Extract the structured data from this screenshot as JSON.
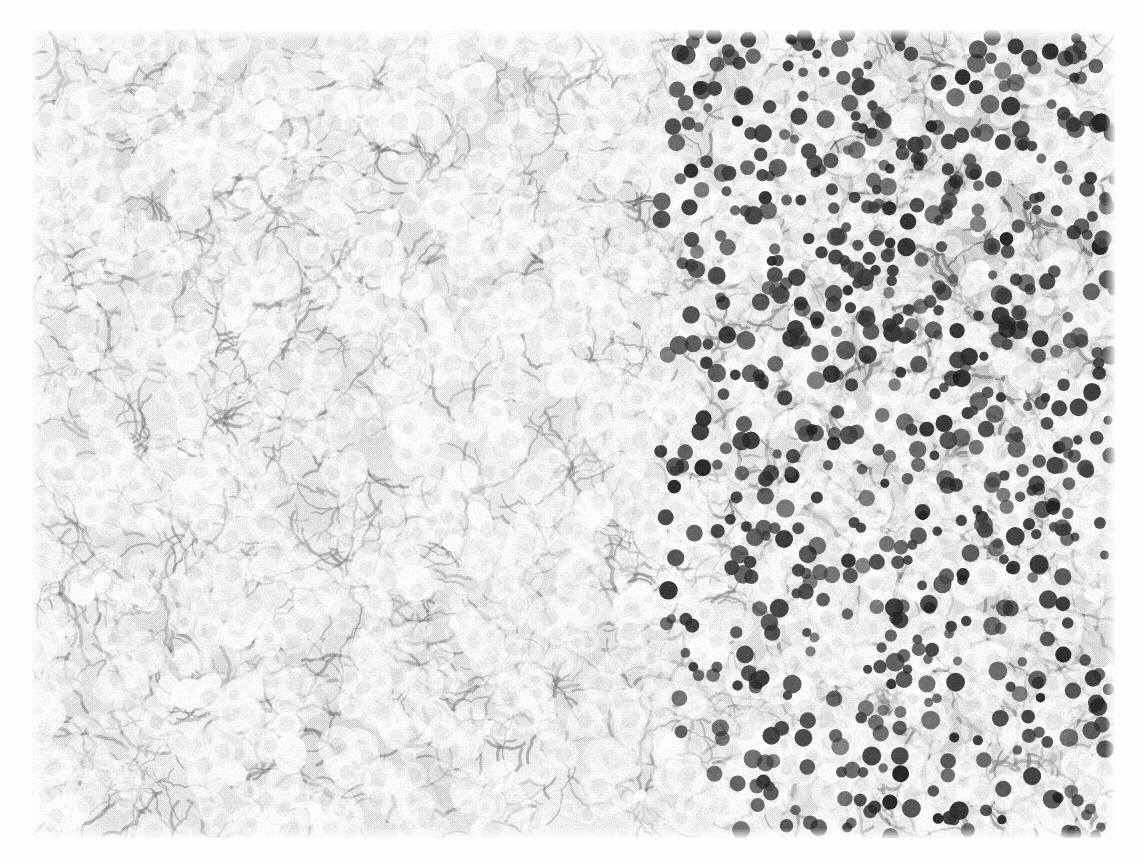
{
  "page": {
    "kind": "printed-page-scan",
    "background_color": "#fefefe",
    "width": 1144,
    "height": 860
  },
  "figure": {
    "name": "histology-micrograph",
    "modality": "light-microscopy",
    "stain": "hematoxylin-and-eosin",
    "color_mode": "grayscale",
    "tissue": "liver-hepatocellular-parenchyma",
    "bounds": {
      "x": 32,
      "y": 30,
      "width": 1083,
      "height": 808
    },
    "tone": {
      "paper_white": "#fdfdfd",
      "cytoplasm_light": "#f4f4f2",
      "stroma_mid": "#9a9a98",
      "nucleus_dark": "#3a3a3a",
      "darkest": "#202020"
    },
    "regions": [
      {
        "name": "upper-right-dense",
        "x": 0.62,
        "y": 0.02,
        "w": 0.38,
        "h": 0.42,
        "density": 1.0
      },
      {
        "name": "right-band-dense",
        "x": 0.78,
        "y": 0.3,
        "w": 0.22,
        "h": 0.7,
        "density": 0.92
      },
      {
        "name": "upper-left-moderate",
        "x": 0.0,
        "y": 0.0,
        "w": 0.34,
        "h": 0.34,
        "density": 0.8
      },
      {
        "name": "central-pale",
        "x": 0.18,
        "y": 0.38,
        "w": 0.42,
        "h": 0.4,
        "density": 0.46
      },
      {
        "name": "lower-left-moderate",
        "x": 0.0,
        "y": 0.62,
        "w": 0.32,
        "h": 0.38,
        "density": 0.7
      },
      {
        "name": "lower-centre-moderate",
        "x": 0.34,
        "y": 0.66,
        "w": 0.36,
        "h": 0.34,
        "density": 0.62
      }
    ],
    "nuclei": {
      "count": 2600,
      "mean_radius_px": 7.2,
      "radius_min_px": 4.0,
      "radius_max_px": 11.5,
      "shape": "round-to-ovoid"
    },
    "texture": {
      "halftone_dots": true,
      "sinusoid_strands": 1500,
      "clear_vacuoles": 420,
      "grain": 0.16
    }
  },
  "caption": {
    "visible": false,
    "ghost_text": ""
  },
  "seed": 20240517
}
